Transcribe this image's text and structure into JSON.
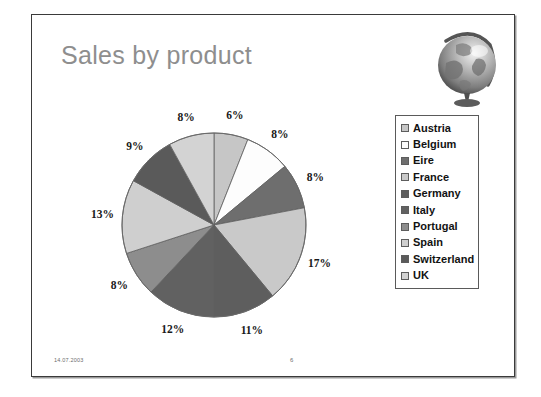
{
  "slide": {
    "title": "Sales by product",
    "footer_date": "14.07.2003",
    "footer_page": "6"
  },
  "globe": {
    "icon_name": "globe-image",
    "alt": "desk globe"
  },
  "chart_data": {
    "type": "pie",
    "title": "Sales by product",
    "categories": [
      "Austria",
      "Belgium",
      "Eire",
      "France",
      "Germany",
      "Italy",
      "Portugal",
      "Spain",
      "Switzerland",
      "UK"
    ],
    "values": [
      6,
      8,
      8,
      17,
      11,
      12,
      8,
      13,
      9,
      8
    ],
    "labels": [
      "6%",
      "8%",
      "8%",
      "17%",
      "11%",
      "12%",
      "8%",
      "13%",
      "9%",
      "8%"
    ],
    "colors": [
      "#c6c6c6",
      "#fdfdfd",
      "#6e6e6e",
      "#c9c9c9",
      "#5e5e5e",
      "#616161",
      "#8d8d8d",
      "#cfcfcf",
      "#5a5a5a",
      "#d3d3d3"
    ],
    "start_angle": 0,
    "direction": "clockwise",
    "legend_position": "right",
    "grid": false,
    "xlabel": "",
    "ylabel": ""
  },
  "legend": {
    "items": [
      {
        "label": "Austria",
        "color": "#c6c6c6"
      },
      {
        "label": "Belgium",
        "color": "#fdfdfd"
      },
      {
        "label": "Eire",
        "color": "#6e6e6e"
      },
      {
        "label": "France",
        "color": "#c9c9c9"
      },
      {
        "label": "Germany",
        "color": "#5e5e5e"
      },
      {
        "label": "Italy",
        "color": "#616161"
      },
      {
        "label": "Portugal",
        "color": "#8d8d8d"
      },
      {
        "label": "Spain",
        "color": "#cfcfcf"
      },
      {
        "label": "Switzerland",
        "color": "#5a5a5a"
      },
      {
        "label": "UK",
        "color": "#d3d3d3"
      }
    ]
  }
}
